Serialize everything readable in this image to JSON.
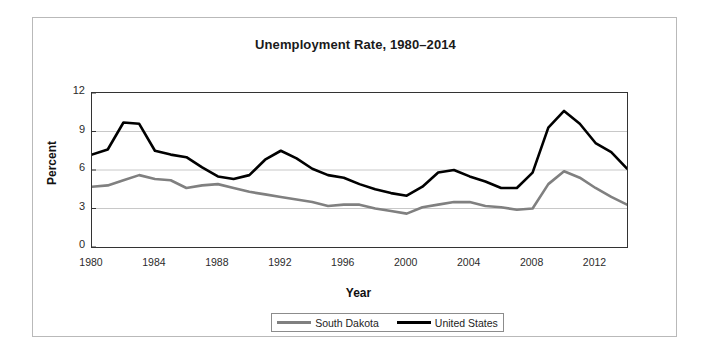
{
  "chart_data": {
    "type": "line",
    "title": "Unemployment Rate, 1980–2014",
    "xlabel": "Year",
    "ylabel": "Percent",
    "xlim": [
      1980,
      2014
    ],
    "ylim": [
      0,
      12
    ],
    "grid": "horizontal",
    "legend_position": "bottom-center",
    "x": [
      1980,
      1981,
      1982,
      1983,
      1984,
      1985,
      1986,
      1987,
      1988,
      1989,
      1990,
      1991,
      1992,
      1993,
      1994,
      1995,
      1996,
      1997,
      1998,
      1999,
      2000,
      2001,
      2002,
      2003,
      2004,
      2005,
      2006,
      2007,
      2008,
      2009,
      2010,
      2011,
      2012,
      2013,
      2014
    ],
    "ytick_labels": [
      "0",
      "3",
      "6",
      "9",
      "12"
    ],
    "ytick_values": [
      0,
      3,
      6,
      9,
      12
    ],
    "xtick_labels": [
      "1980",
      "1984",
      "1988",
      "1992",
      "1996",
      "2000",
      "2004",
      "2008",
      "2012"
    ],
    "xtick_values": [
      1980,
      1984,
      1988,
      1992,
      1996,
      2000,
      2004,
      2008,
      2012
    ],
    "series": [
      {
        "name": "South Dakota",
        "color": "#808080",
        "values": [
          4.7,
          4.8,
          5.2,
          5.6,
          5.3,
          5.2,
          4.6,
          4.8,
          4.9,
          4.6,
          4.3,
          4.1,
          3.9,
          3.7,
          3.5,
          3.2,
          3.3,
          3.3,
          3.0,
          2.8,
          2.6,
          3.1,
          3.3,
          3.5,
          3.5,
          3.2,
          3.1,
          2.9,
          3.0,
          4.9,
          5.9,
          5.4,
          4.6,
          3.9,
          3.3
        ]
      },
      {
        "name": "United States",
        "color": "#000000",
        "values": [
          7.2,
          7.6,
          9.7,
          9.6,
          7.5,
          7.2,
          7.0,
          6.2,
          5.5,
          5.3,
          5.6,
          6.8,
          7.5,
          6.9,
          6.1,
          5.6,
          5.4,
          4.9,
          4.5,
          4.2,
          4.0,
          4.7,
          5.8,
          6.0,
          5.5,
          5.1,
          4.6,
          4.6,
          5.8,
          9.3,
          10.6,
          9.6,
          8.1,
          7.4,
          6.1
        ]
      }
    ]
  },
  "legend": {
    "entries": [
      {
        "label": "South Dakota"
      },
      {
        "label": "United States"
      }
    ]
  }
}
